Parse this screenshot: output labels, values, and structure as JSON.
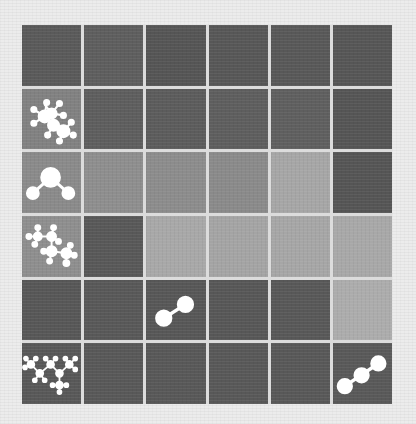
{
  "game": {
    "type": "molecule tile grid",
    "rows": 6,
    "cols": 6,
    "colors": {
      "dark": "#575757",
      "dark_alt": "#5e5e5e",
      "medium": "#838383",
      "medium_light": "#8c8c8c",
      "light": "#a8a8a8",
      "icon": "#ffffff",
      "gridline": "#dcdcdc",
      "background": "#ececec"
    },
    "cells": [
      [
        {
          "shade": "#5a5a5a",
          "icon": null
        },
        {
          "shade": "#5e5e5e",
          "icon": null
        },
        {
          "shade": "#555555",
          "icon": null
        },
        {
          "shade": "#575757",
          "icon": null
        },
        {
          "shade": "#585858",
          "icon": null
        },
        {
          "shade": "#565656",
          "icon": null
        }
      ],
      [
        {
          "shade": "#818181",
          "icon": "benzene-like-molecule-icon"
        },
        {
          "shade": "#5e5e5e",
          "icon": null
        },
        {
          "shade": "#5c5c5c",
          "icon": null
        },
        {
          "shade": "#5e5e5e",
          "icon": null
        },
        {
          "shade": "#5f5f5f",
          "icon": null
        },
        {
          "shade": "#555555",
          "icon": null
        }
      ],
      [
        {
          "shade": "#8a8a8a",
          "icon": "water-molecule-icon"
        },
        {
          "shade": "#8e8e8e",
          "icon": null
        },
        {
          "shade": "#8c8c8c",
          "icon": null
        },
        {
          "shade": "#8a8a8a",
          "icon": null
        },
        {
          "shade": "#a6a6a6",
          "icon": null
        },
        {
          "shade": "#555555",
          "icon": null
        }
      ],
      [
        {
          "shade": "#8e8e8e",
          "icon": "propane-molecule-icon"
        },
        {
          "shade": "#585858",
          "icon": null
        },
        {
          "shade": "#a8a8a8",
          "icon": null
        },
        {
          "shade": "#a4a4a4",
          "icon": null
        },
        {
          "shade": "#a6a6a6",
          "icon": null
        },
        {
          "shade": "#a8a8a8",
          "icon": null
        }
      ],
      [
        {
          "shade": "#575757",
          "icon": null
        },
        {
          "shade": "#585858",
          "icon": null
        },
        {
          "shade": "#575757",
          "icon": "diatomic-molecule-icon"
        },
        {
          "shade": "#575757",
          "icon": null
        },
        {
          "shade": "#585858",
          "icon": null
        },
        {
          "shade": "#acacac",
          "icon": null
        }
      ],
      [
        {
          "shade": "#585858",
          "icon": "branched-alkane-molecule-icon"
        },
        {
          "shade": "#585858",
          "icon": null
        },
        {
          "shade": "#585858",
          "icon": null
        },
        {
          "shade": "#585858",
          "icon": null
        },
        {
          "shade": "#585858",
          "icon": null
        },
        {
          "shade": "#595959",
          "icon": "triatomic-chain-molecule-icon"
        }
      ]
    ]
  }
}
